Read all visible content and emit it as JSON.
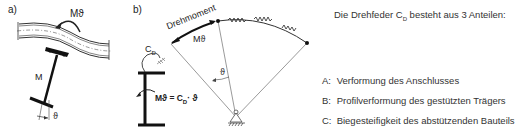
{
  "panel_a": {
    "label": "a)",
    "moment_label": "Mϑ",
    "member_label": "M",
    "angle_label": "ϑ"
  },
  "panel_b": {
    "label": "b)",
    "torque_label": "Drehmoment",
    "moment_label": "Mϑ",
    "angle_label": "ϑ",
    "spring_label": "C",
    "spring_sub": "D",
    "equation_left": "Mϑ = C",
    "equation_sub": "D",
    "equation_right": "· ϑ"
  },
  "description": {
    "title_pre": "Die Drehfeder C",
    "title_sub": "D",
    "title_post": " besteht aus 3 Anteilen:",
    "items": [
      {
        "key": "A:",
        "text": "Verformung des Anschlusses"
      },
      {
        "key": "B:",
        "text": "Profilverformung des gestützten Trägers"
      },
      {
        "key": "C:",
        "text": "Biegesteifigkeit des abstützenden Bauteils"
      }
    ]
  }
}
